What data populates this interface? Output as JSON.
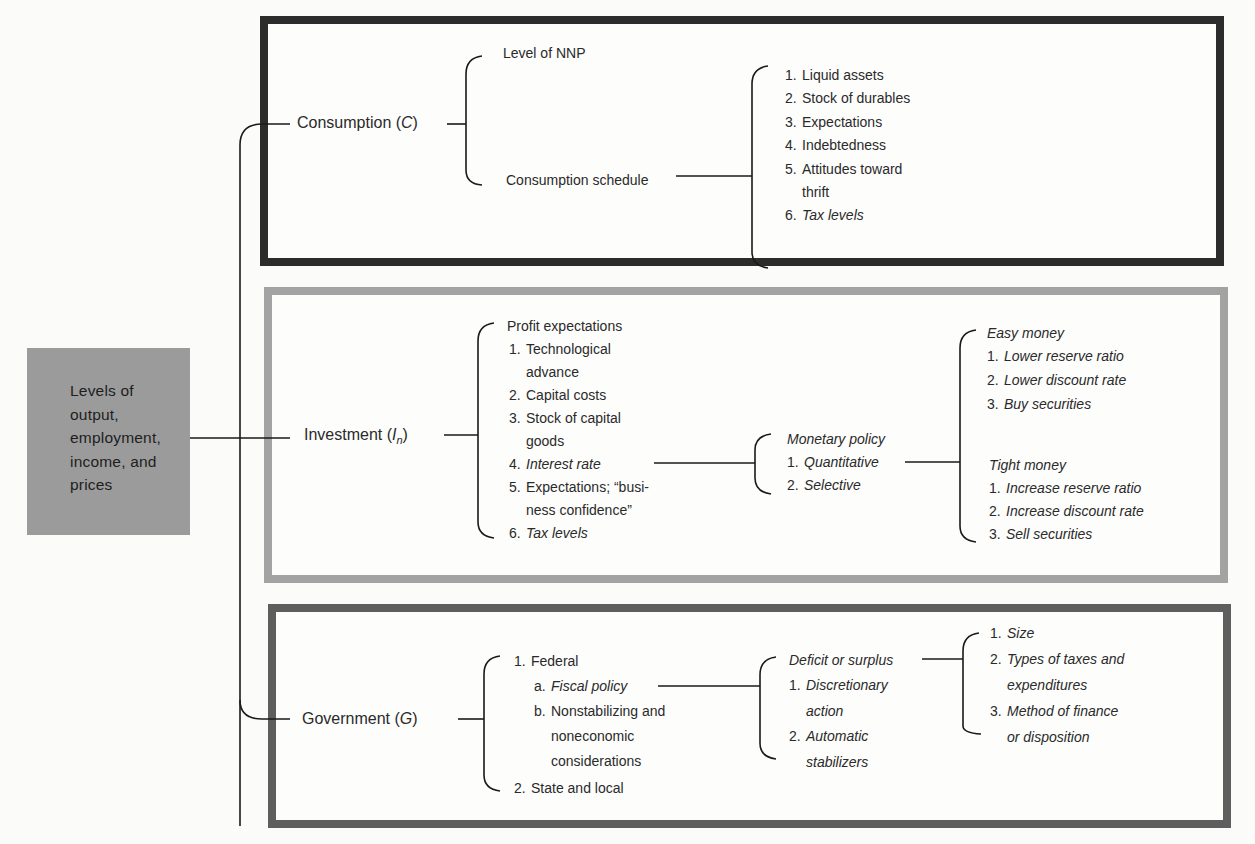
{
  "root": {
    "lines": [
      "Levels of",
      "output,",
      "employment,",
      "income, and",
      "prices"
    ]
  },
  "consumption": {
    "label": "Consumption (",
    "symbol": "C",
    "label_end": ")",
    "branches": {
      "level": "Level of NNP",
      "schedule": "Consumption schedule"
    },
    "determinants": [
      {
        "num": "1.",
        "text": "Liquid assets"
      },
      {
        "num": "2.",
        "text": "Stock of durables"
      },
      {
        "num": "3.",
        "text": "Expectations"
      },
      {
        "num": "4.",
        "text": "Indebtedness"
      },
      {
        "num": "5.",
        "text": "Attitudes toward"
      },
      {
        "num": "",
        "text": "thrift"
      },
      {
        "num": "6.",
        "text": "Tax levels"
      }
    ]
  },
  "investment": {
    "label": "Investment (",
    "symbol": "I",
    "subscript": "n",
    "label_end": ")",
    "heading": "Profit expectations",
    "determinants": [
      {
        "num": "1.",
        "text": "Technological"
      },
      {
        "num": "",
        "text": "advance"
      },
      {
        "num": "2.",
        "text": "Capital costs"
      },
      {
        "num": "3.",
        "text": "Stock of capital"
      },
      {
        "num": "",
        "text": "goods"
      },
      {
        "num": "4.",
        "text": "Interest rate"
      },
      {
        "num": "5.",
        "text": "Expectations; “busi-"
      },
      {
        "num": "",
        "text": "ness confidence”"
      },
      {
        "num": "6.",
        "text": "Tax levels"
      }
    ],
    "monetary": {
      "heading": "Monetary policy",
      "items": [
        {
          "num": "1.",
          "text": "Quantitative"
        },
        {
          "num": "2.",
          "text": "Selective"
        }
      ]
    },
    "easy_money": {
      "heading": "Easy money",
      "items": [
        {
          "num": "1.",
          "text": "Lower reserve ratio"
        },
        {
          "num": "2.",
          "text": "Lower discount rate"
        },
        {
          "num": "3.",
          "text": "Buy securities"
        }
      ]
    },
    "tight_money": {
      "heading": "Tight money",
      "items": [
        {
          "num": "1.",
          "text": "Increase reserve ratio"
        },
        {
          "num": "2.",
          "text": "Increase discount rate"
        },
        {
          "num": "3.",
          "text": "Sell securities"
        }
      ]
    }
  },
  "government": {
    "label": "Government (",
    "symbol": "G",
    "label_end": ")",
    "levels": [
      {
        "num": "1.",
        "text": "Federal"
      },
      {
        "num": "a.",
        "text": "Fiscal policy"
      },
      {
        "num": "b.",
        "text": "Nonstabilizing and"
      },
      {
        "num": "",
        "text": "noneconomic"
      },
      {
        "num": "",
        "text": "considerations"
      },
      {
        "num": "2.",
        "text": "State and local"
      }
    ],
    "deficit": {
      "heading": "Deficit or surplus",
      "items": [
        {
          "num": "1.",
          "text": "Discretionary"
        },
        {
          "num": "",
          "text": "action"
        },
        {
          "num": "2.",
          "text": "Automatic"
        },
        {
          "num": "",
          "text": "stabilizers"
        }
      ]
    },
    "aspects": [
      {
        "num": "1.",
        "text": "Size"
      },
      {
        "num": "2.",
        "text": "Types of taxes and"
      },
      {
        "num": "",
        "text": "expenditures"
      },
      {
        "num": "3.",
        "text": "Method of finance"
      },
      {
        "num": "",
        "text": "or disposition"
      }
    ]
  },
  "colors": {
    "consumption_frame": "#2c2c2c",
    "investment_frame": "#a3a3a3",
    "government_frame": "#5e5e5e",
    "root_box": "#9b9b9b"
  }
}
